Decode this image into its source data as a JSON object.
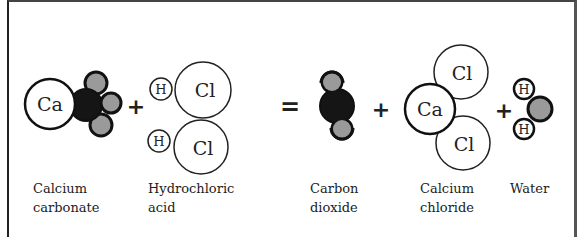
{
  "reaction": {
    "operators": {
      "plus": "+",
      "equals": "="
    },
    "reactants": [
      {
        "name_line1": "Calcium",
        "name_line2": "carbonate",
        "atoms": {
          "ca": "Ca"
        }
      },
      {
        "name_line1": "Hydrochloric",
        "name_line2": "acid",
        "atoms": {
          "h1": "H",
          "cl1": "Cl",
          "h2": "H",
          "cl2": "Cl"
        }
      }
    ],
    "products": [
      {
        "name_line1": "Carbon",
        "name_line2": "dioxide"
      },
      {
        "name_line1": "Calcium",
        "name_line2": "chloride",
        "atoms": {
          "ca": "Ca",
          "cl1": "Cl",
          "cl2": "Cl"
        }
      },
      {
        "name_line1": "Water",
        "atoms": {
          "h1": "H",
          "h2": "H"
        }
      }
    ]
  },
  "colors": {
    "carbon": "#151515",
    "oxygen": "#9a9a9a",
    "outline": "#111111",
    "background": "#ffffff"
  }
}
